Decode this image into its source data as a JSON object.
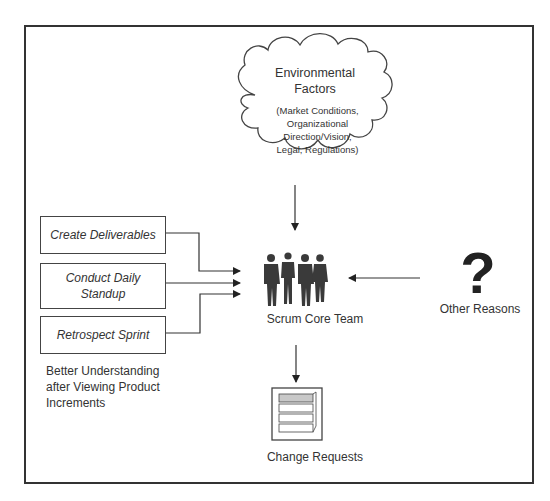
{
  "diagram": {
    "environmental_factors": {
      "title_line1": "Environmental",
      "title_line2": "Factors",
      "details": [
        "(Market Conditions,",
        "Organizational",
        "Direction/Vision,",
        "Legal, Regulations)"
      ],
      "icon": "cloud-icon"
    },
    "processes": [
      {
        "label": "Create Deliverables"
      },
      {
        "label_line1": "Conduct Daily",
        "label_line2": "Standup"
      },
      {
        "label": "Retrospect Sprint"
      }
    ],
    "better_understanding": [
      "Better Understanding",
      "after Viewing Product",
      "Increments"
    ],
    "scrum_core_team": {
      "label": "Scrum Core Team",
      "icon": "team-silhouette-icon"
    },
    "other_reasons": {
      "label": "Other Reasons",
      "glyph": "?",
      "icon": "question-mark-icon"
    },
    "change_requests": {
      "label": "Change Requests",
      "icon": "stacked-documents-icon"
    },
    "colors": {
      "stroke": "#333333",
      "background": "#ffffff",
      "stack_highlight": "#c8c8c8"
    }
  }
}
